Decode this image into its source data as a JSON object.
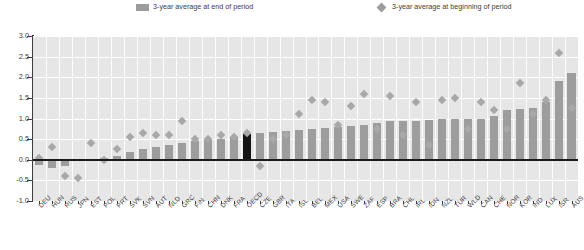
{
  "legend": {
    "end_label": "3-year average at end of period",
    "begin_label": "3-year average at beginning of period",
    "bar_color": "#9d9d9d",
    "dot_color": "#a8a8a8",
    "highlight_color": "#141414"
  },
  "chart_data": {
    "type": "bar",
    "title": "",
    "subtitle": "",
    "xlabel": "",
    "ylabel": "",
    "ylim": [
      -1.0,
      3.0
    ],
    "yticks": [
      3.0,
      2.5,
      2.0,
      1.5,
      1.0,
      0.5,
      0.0,
      -0.5,
      -1.0
    ],
    "ytick_labels": [
      "3.0",
      "2.5",
      "2.0",
      "1.5",
      "1.0",
      "0.5",
      "0.0",
      "-0.5",
      "-1.0"
    ],
    "grid": true,
    "legend_position": "top",
    "highlight_category": "OECD",
    "categories": [
      "DEU",
      "HUN",
      "RUS",
      "JPN",
      "EST",
      "POL",
      "PRT",
      "SVK",
      "SVN",
      "AUT",
      "NLD",
      "GRC",
      "FIN",
      "CHN",
      "DNK",
      "FRA",
      "OECD",
      "CZE",
      "GBR",
      "ITA",
      "ISL",
      "BEL",
      "MEX",
      "USA",
      "SWE",
      "ZAF",
      "ESP",
      "BRA",
      "CHL",
      "IRL",
      "IDN",
      "NZL",
      "TUR",
      "WLD",
      "CAN",
      "CHE",
      "NOR",
      "KOR",
      "IND",
      "LUX",
      "ISR",
      "AUS"
    ],
    "series": [
      {
        "name": "3-year average at end of period",
        "type": "bar",
        "values": [
          -0.12,
          -0.2,
          -0.15,
          -0.03,
          0.0,
          0.05,
          0.1,
          0.2,
          0.27,
          0.3,
          0.36,
          0.4,
          0.45,
          0.47,
          0.5,
          0.55,
          0.62,
          0.65,
          0.67,
          0.7,
          0.72,
          0.75,
          0.78,
          0.8,
          0.82,
          0.85,
          0.9,
          0.95,
          0.95,
          0.95,
          0.97,
          1.0,
          1.0,
          1.0,
          1.0,
          1.05,
          1.2,
          1.22,
          1.25,
          1.4,
          1.9,
          2.1
        ]
      },
      {
        "name": "3-year average at beginning of period",
        "type": "scatter",
        "values": [
          0.05,
          0.3,
          -0.4,
          -0.45,
          0.4,
          0.0,
          0.25,
          0.55,
          0.65,
          0.6,
          0.6,
          0.95,
          0.5,
          0.5,
          0.6,
          0.55,
          0.65,
          -0.15,
          0.5,
          0.6,
          1.1,
          1.45,
          1.4,
          0.85,
          1.3,
          1.6,
          0.75,
          1.55,
          0.6,
          1.4,
          0.35,
          1.45,
          1.5,
          0.75,
          1.4,
          1.2,
          0.75,
          1.85,
          1.1,
          1.45,
          2.6,
          1.25
        ]
      }
    ]
  }
}
